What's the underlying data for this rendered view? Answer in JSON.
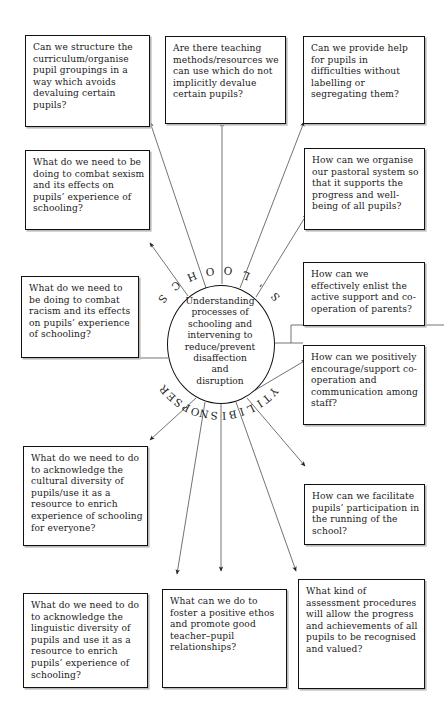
{
  "diagram": {
    "title_arc_top": "SCHOOL'S",
    "title_arc_bottom": "RESPONSIBILITY",
    "center": "Understanding processes of schooling and intervening to reduce/prevent disaffection and disruption",
    "center_lines": [
      "Understanding",
      "processes of",
      "schooling and",
      "intervening to",
      "reduce/prevent",
      "disaffection",
      "and",
      "disruption"
    ],
    "boxes": [
      {
        "id": "curriculum",
        "text": "Can we structure the curriculum/organise pupil groupings in a way which avoids devaluing certain pupils?"
      },
      {
        "id": "teaching",
        "text": "Are there teaching methods/resources we can use which do not implicitly devalue certain pupils?"
      },
      {
        "id": "help",
        "text": "Can we provide help for pupils in difficulties without labelling or segregating them?"
      },
      {
        "id": "sexism",
        "text": "What do we need to be doing to combat sexism and its effects on pupils’ experience of schooling?"
      },
      {
        "id": "pastoral",
        "text": "How can we organise our pastoral system so that it supports the progress and well-being of all pupils?"
      },
      {
        "id": "racism",
        "text": "What do we need to be doing to combat racism and its effects on pupils’ experience of schooling?"
      },
      {
        "id": "parents",
        "text": "How can we effectively enlist the active support and co-operation of parents?"
      },
      {
        "id": "staff",
        "text": "How can we positively encourage/support co-operation and communication among staff?"
      },
      {
        "id": "cultural",
        "text": "What do we need to do to acknowledge the cultural diversity of pupils/use it as a resource to enrich experience of schooling for everyone?"
      },
      {
        "id": "facilitate",
        "text": "How can we facilitate pupils’ participation in the running of the school?"
      },
      {
        "id": "linguistic",
        "text": "What do we need to do to acknowledge the linguistic diversity of pupils and use it as a resource to enrich pupils’ experience of schooling?"
      },
      {
        "id": "ethos",
        "text": "What can we do to foster a positive ethos and promote good teacher–pupil relationships?"
      },
      {
        "id": "assessment",
        "text": "What kind of assessment procedures will allow the progress and achievements of all pupils to be recognised and valued?"
      }
    ]
  }
}
